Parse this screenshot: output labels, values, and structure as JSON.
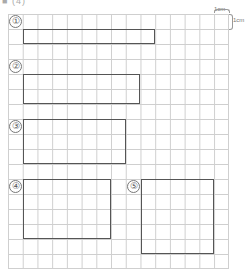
{
  "header": {
    "text": "■ (4)"
  },
  "scale": {
    "top_label": "1cm",
    "side_label": "1cm"
  },
  "grid": {
    "columns": 15,
    "rows": 17,
    "cell_unit": "1cm",
    "line_color": "#cfcfcf"
  },
  "shapes": [
    {
      "label": "①",
      "col": 1,
      "row": 1,
      "width_cells": 9,
      "height_cells": 1
    },
    {
      "label": "②",
      "col": 1,
      "row": 4,
      "width_cells": 8,
      "height_cells": 2
    },
    {
      "label": "③",
      "col": 1,
      "row": 7,
      "width_cells": 7,
      "height_cells": 3
    },
    {
      "label": "④",
      "col": 1,
      "row": 11,
      "width_cells": 6,
      "height_cells": 4
    },
    {
      "label": "⑤",
      "col": 9,
      "row": 11,
      "width_cells": 5,
      "height_cells": 5
    }
  ],
  "colors": {
    "shape_border": "#555555",
    "grid": "#cfcfcf"
  }
}
